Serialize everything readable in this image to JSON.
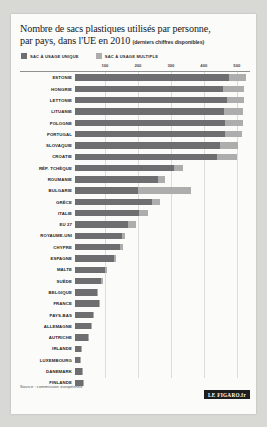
{
  "title": {
    "line1": "Nombre de sacs plastiques utilisés par personne,",
    "line2": "par pays, dans l'UE en 2010",
    "subtitle": "(derniers chiffres disponibles)"
  },
  "legend": {
    "items": [
      {
        "label": "SAC À USAGE UNIQUE",
        "color": "#6e6e70",
        "icon": "legend-swatch-icon"
      },
      {
        "label": "SAC À USAGE MULTIPLE",
        "color": "#adadad",
        "icon": "legend-swatch-icon"
      }
    ]
  },
  "source": "Source : commission européenne",
  "logo": "LE FIGARO.fr",
  "chart_data": {
    "type": "bar",
    "orientation": "horizontal",
    "stacked": true,
    "title": "Nombre de sacs plastiques utilisés par personne, par pays, dans l'UE en 2010",
    "subtitle": "(derniers chiffres disponibles)",
    "xlabel": "",
    "ylabel": "",
    "xlim": [
      0,
      540
    ],
    "ticks": [
      100,
      200,
      300,
      400,
      500
    ],
    "tick_labels": [
      "100",
      "200",
      "300",
      "400",
      "500"
    ],
    "grid": true,
    "legend_position": "top-left",
    "categories": [
      "ESTONIE",
      "HONGRIE",
      "LETTONIE",
      "LITUANIE",
      "POLOGNE",
      "PORTUGAL",
      "SLOVAQUIE",
      "CROATIE",
      "RÉP. TCHÈQUE",
      "ROUMANIE",
      "BULGARIE",
      "GRÈCE",
      "ITALIE",
      "EU 27",
      "ROYAUME-UNI",
      "CHYPRE",
      "ESPAGNE",
      "MALTE",
      "SUÈDE",
      "BELGIQUE",
      "FRANCE",
      "PAYS-BAS",
      "ALLEMAGNE",
      "AUTRICHE",
      "IRLANDE",
      "LUXEMBOURG",
      "DANEMARK",
      "FINLANDE"
    ],
    "series": [
      {
        "name": "SAC À USAGE UNIQUE",
        "color": "#6e6e70",
        "values": [
          466,
          450,
          460,
          452,
          456,
          454,
          440,
          432,
          300,
          252,
          192,
          234,
          194,
          160,
          142,
          138,
          118,
          92,
          80,
          68,
          72,
          56,
          50,
          40,
          18,
          16,
          22,
          24
        ]
      },
      {
        "name": "SAC À USAGE MULTIPLE",
        "color": "#adadad",
        "values": [
          54,
          62,
          52,
          58,
          54,
          52,
          54,
          60,
          28,
          22,
          160,
          24,
          26,
          24,
          10,
          8,
          6,
          4,
          4,
          3,
          2,
          2,
          2,
          2,
          1,
          1,
          2,
          2
        ]
      }
    ],
    "totals": [
      520,
      512,
      512,
      510,
      510,
      506,
      494,
      492,
      328,
      274,
      352,
      258,
      220,
      184,
      152,
      146,
      124,
      96,
      84,
      71,
      74,
      58,
      52,
      42,
      19,
      17,
      24,
      26
    ]
  }
}
